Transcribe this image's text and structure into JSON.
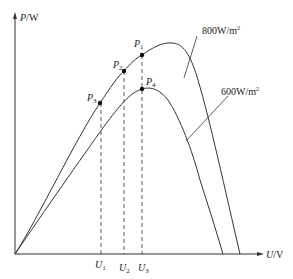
{
  "diagram": {
    "type": "P-U characteristic curves (photovoltaic)",
    "axes": {
      "y_label": {
        "var": "P",
        "unit": "/W"
      },
      "x_label": {
        "var": "U",
        "unit": "/V"
      }
    },
    "curves": [
      {
        "name": "800W/m2",
        "label": "800W/m",
        "label_sup": "2",
        "color": "#333333"
      },
      {
        "name": "600W/m2",
        "label": "600W/m",
        "label_sup": "2",
        "color": "#333333"
      }
    ],
    "points": [
      {
        "id": "P1",
        "var": "P",
        "sub": "1"
      },
      {
        "id": "P2",
        "var": "P",
        "sub": "2"
      },
      {
        "id": "P3",
        "var": "P",
        "sub": "3"
      },
      {
        "id": "P4",
        "var": "P",
        "sub": "4"
      }
    ],
    "voltage_ticks": [
      {
        "id": "U1",
        "var": "U",
        "sub": "1"
      },
      {
        "id": "U2",
        "var": "U",
        "sub": "2"
      },
      {
        "id": "U3",
        "var": "U",
        "sub": "3"
      }
    ]
  }
}
